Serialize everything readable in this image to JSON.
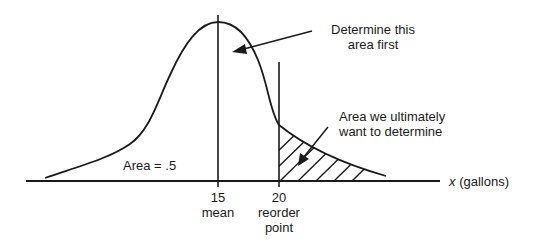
{
  "diagram": {
    "type": "normal-distribution",
    "x_axis_variable": "x",
    "x_axis_unit_label": "(gallons)",
    "ticks": [
      {
        "value": "15",
        "caption_lines": [
          "mean"
        ]
      },
      {
        "value": "20",
        "caption_lines": [
          "reorder",
          "point"
        ]
      }
    ],
    "annotations": {
      "left_area": "Area = .5",
      "first_area_line1": "Determine this",
      "first_area_line2": "area first",
      "target_area_line1": "Area we ultimately",
      "target_area_line2": "want to determine"
    },
    "colors": {
      "line": "#1a1a1a",
      "background": "#ffffff"
    }
  }
}
